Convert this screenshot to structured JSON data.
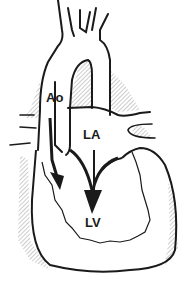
{
  "diagram": {
    "labels": {
      "aorta": "Ao",
      "left_atrium": "LA",
      "left_ventricle": "LV"
    },
    "arrows": [
      {
        "from": "Ao",
        "to": "LV",
        "style": "black filled arrow"
      },
      {
        "from": "LA",
        "to": "LV",
        "style": "black filled arrow"
      }
    ],
    "colors": {
      "line": "#1a1a1a",
      "hatch": "#9a9a9a",
      "background": "#ffffff"
    }
  }
}
